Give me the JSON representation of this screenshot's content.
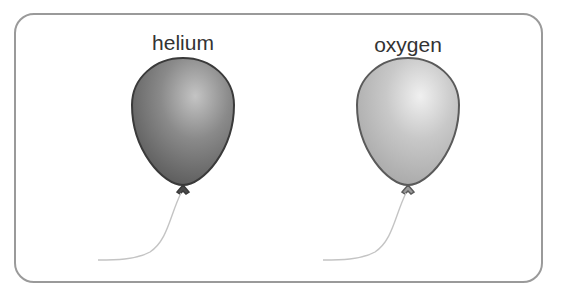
{
  "balloons": [
    {
      "label": "helium",
      "fill_color": "#7a7a7a",
      "highlight_color": "#c8c8c8"
    },
    {
      "label": "oxygen",
      "fill_color": "#bdbdbd",
      "highlight_color": "#ececec"
    }
  ]
}
